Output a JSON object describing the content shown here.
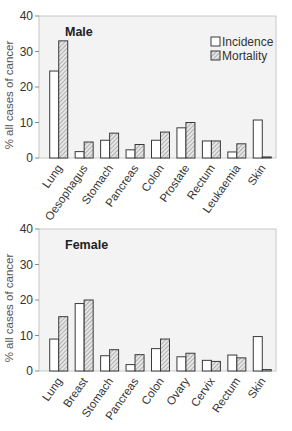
{
  "chart_data": [
    {
      "type": "bar",
      "title": "Male",
      "xlabel": "",
      "ylabel": "% all cases of cancer",
      "ylim": [
        0,
        40
      ],
      "yticks": [
        0,
        10,
        20,
        30,
        40
      ],
      "grid": false,
      "legend_position": "top-right",
      "categories": [
        "Lung",
        "Oesophagus",
        "Stomach",
        "Pancreas",
        "Colon",
        "Prostate",
        "Rectum",
        "Leukaemia",
        "Skin"
      ],
      "series": [
        {
          "name": "Incidence",
          "pattern": "open",
          "values": [
            24.5,
            1.8,
            5.0,
            2.3,
            5.0,
            8.5,
            4.8,
            1.7,
            10.7
          ]
        },
        {
          "name": "Mortality",
          "pattern": "hatched",
          "values": [
            33.0,
            4.5,
            7.0,
            3.8,
            7.3,
            10.0,
            4.8,
            4.0,
            0.3
          ]
        }
      ]
    },
    {
      "type": "bar",
      "title": "Female",
      "xlabel": "",
      "ylabel": "% all cases of cancer",
      "ylim": [
        0,
        40
      ],
      "yticks": [
        0,
        10,
        20,
        30,
        40
      ],
      "grid": false,
      "legend_position": "none",
      "categories": [
        "Lung",
        "Breast",
        "Stomach",
        "Pancreas",
        "Colon",
        "Ovary",
        "Cervix",
        "Rectum",
        "Skin"
      ],
      "series": [
        {
          "name": "Incidence",
          "pattern": "open",
          "values": [
            9.0,
            19.0,
            4.3,
            1.8,
            6.3,
            4.0,
            3.0,
            4.5,
            9.7
          ]
        },
        {
          "name": "Mortality",
          "pattern": "hatched",
          "values": [
            15.3,
            20.0,
            6.0,
            4.6,
            9.0,
            5.0,
            2.7,
            3.7,
            0.4
          ]
        }
      ]
    }
  ],
  "legend": {
    "items": [
      {
        "label": "Incidence"
      },
      {
        "label": "Mortality"
      }
    ]
  },
  "colors": {
    "plot_bg": "#f3f3f3",
    "frame": "#c8c8c8",
    "bar_stroke": "#3a3a3a",
    "text": "#333333"
  }
}
